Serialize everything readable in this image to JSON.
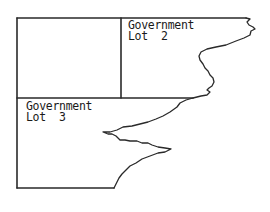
{
  "diagram": {
    "type": "survey-plat",
    "colors": {
      "line": "#2a2a2a",
      "background": "#ffffff"
    },
    "lots": [
      {
        "id": "lot2",
        "line1": "Government",
        "line2": "Lot  2"
      },
      {
        "id": "lot3",
        "line1": "Government",
        "line2": "Lot  3"
      }
    ],
    "features": [
      "boundary-lines",
      "lot-divider",
      "irregular-shoreline"
    ]
  }
}
